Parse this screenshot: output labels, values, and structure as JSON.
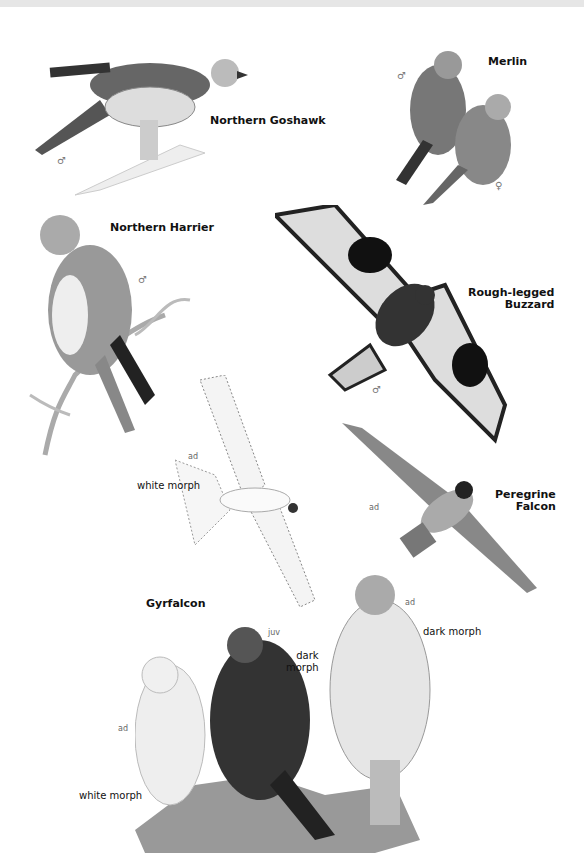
{
  "plate": {
    "species": [
      {
        "name": "Northern Goshawk",
        "sex": "♂"
      },
      {
        "name": "Merlin",
        "sexes": [
          "♂",
          "♀"
        ]
      },
      {
        "name": "Northern Harrier",
        "sex": "♂"
      },
      {
        "name": "Rough-legged",
        "name2": "Buzzard",
        "sex": "♂"
      },
      {
        "name": "Peregrine",
        "name2": "Falcon",
        "age": "ad"
      },
      {
        "name": "Gyrfalcon"
      }
    ],
    "gyr_flight": {
      "age": "ad",
      "morph": "white morph"
    },
    "gyr_perched": [
      {
        "age": "ad",
        "morph": "white morph"
      },
      {
        "age": "juv",
        "morph_line1": "dark",
        "morph_line2": "morph"
      },
      {
        "age": "ad",
        "morph": "dark morph"
      }
    ]
  }
}
